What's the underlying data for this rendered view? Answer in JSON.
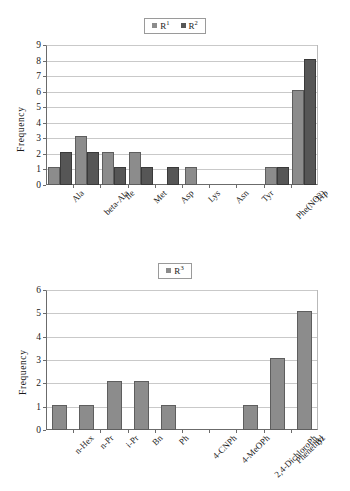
{
  "chart_data": [
    {
      "type": "bar",
      "id": "chart-r1-r2",
      "title": "",
      "xlabel": "",
      "ylabel": "Frequency",
      "ylim": [
        0,
        9
      ],
      "yticks": [
        0,
        1,
        2,
        3,
        4,
        5,
        6,
        7,
        8,
        9
      ],
      "grid": true,
      "legend_position": "top-center",
      "categories": [
        "Ala",
        "beta-Ala",
        "Ile",
        "Met",
        "Asp",
        "Lys",
        "Asn",
        "Tyr",
        "Phe(NO2)",
        "Trp"
      ],
      "series": [
        {
          "name": "R1",
          "label_html": "R",
          "superscript": "1",
          "color": "#8c8c8c",
          "values": [
            1,
            3,
            2,
            2,
            0,
            1,
            0,
            0,
            1,
            6
          ]
        },
        {
          "name": "R2",
          "label_html": "R",
          "superscript": "2",
          "color": "#565656",
          "values": [
            2,
            2,
            1,
            1,
            1,
            0,
            0,
            0,
            1,
            8
          ]
        }
      ]
    },
    {
      "type": "bar",
      "id": "chart-r3",
      "title": "",
      "xlabel": "",
      "ylabel": "Frequency",
      "ylim": [
        0,
        6
      ],
      "yticks": [
        0,
        1,
        2,
        3,
        4,
        5,
        6
      ],
      "grid": true,
      "legend_position": "top-center",
      "categories": [
        "n-Hex",
        "n-Pr",
        "i-Pr",
        "Bn",
        "Ph",
        "4-CNPh",
        "4-MeOPh",
        "2,4-DichloroPh",
        "Phenethyl",
        "Bz"
      ],
      "series": [
        {
          "name": "R3",
          "label_html": "R",
          "superscript": "3",
          "color": "#8c8c8c",
          "values": [
            1,
            1,
            2,
            2,
            1,
            0,
            0,
            1,
            3,
            5
          ]
        }
      ]
    }
  ]
}
